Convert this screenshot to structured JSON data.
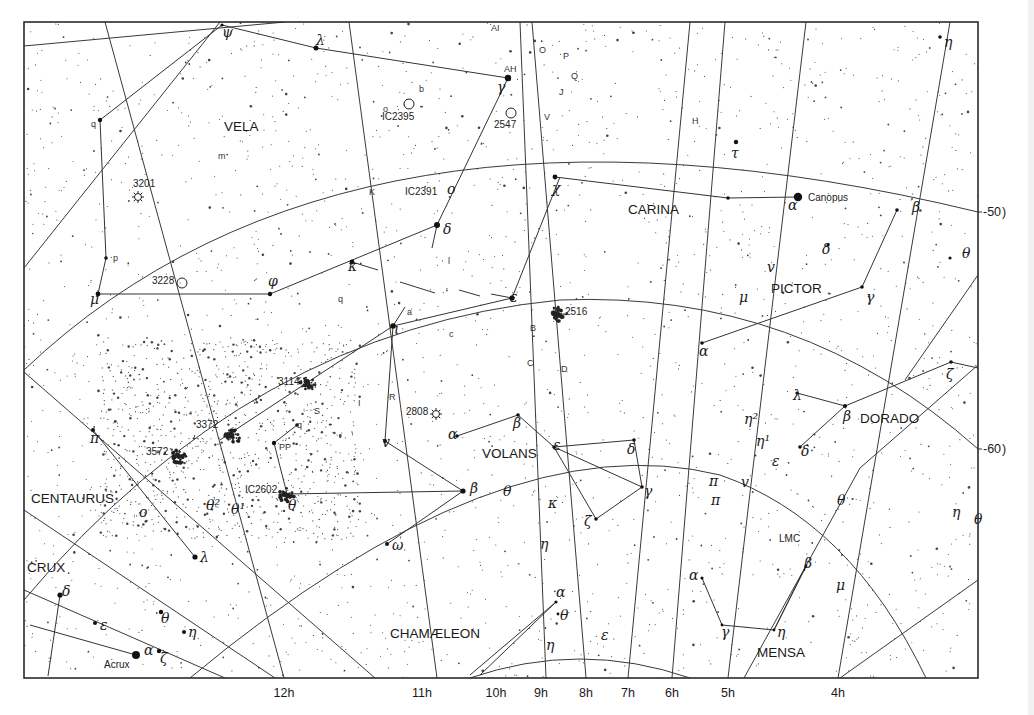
{
  "chart": {
    "frame": {
      "x": 24,
      "y": 22,
      "w": 954,
      "h": 656
    }
  },
  "constellations": [
    {
      "name": "VELA",
      "x": 224,
      "y": 131
    },
    {
      "name": "CARINA",
      "x": 628,
      "y": 214
    },
    {
      "name": "PICTOR",
      "x": 771,
      "y": 293
    },
    {
      "name": "DORADO",
      "x": 860,
      "y": 423
    },
    {
      "name": "VOLANS",
      "x": 482,
      "y": 458
    },
    {
      "name": "CENTAURUS",
      "x": 31,
      "y": 503
    },
    {
      "name": "CRUX",
      "x": 27,
      "y": 572
    },
    {
      "name": "CHAMÆLEON",
      "x": 390,
      "y": 638
    },
    {
      "name": "MENSA",
      "x": 757,
      "y": 657
    }
  ],
  "ra_labels": [
    {
      "label": "12h",
      "x": 284
    },
    {
      "label": "11h",
      "x": 422
    },
    {
      "label": "10h",
      "x": 496
    },
    {
      "label": "9h",
      "x": 541
    },
    {
      "label": "8h",
      "x": 586
    },
    {
      "label": "7h",
      "x": 628
    },
    {
      "label": "6h",
      "x": 672
    },
    {
      "label": "5h",
      "x": 728
    },
    {
      "label": "4h",
      "x": 838
    }
  ],
  "dec_labels": [
    {
      "label": "-50 )",
      "y": 212
    },
    {
      "label": "-60 )",
      "y": 449
    }
  ],
  "named_stars": [
    {
      "name": "Canopus",
      "x": 798,
      "y": 197,
      "r": 4.2,
      "lx": 808,
      "ly": 201
    },
    {
      "name": "Acrux",
      "x": 136,
      "y": 655,
      "r": 4,
      "lx": 104,
      "ly": 668
    }
  ],
  "greek_labels": [
    {
      "t": "ψ",
      "x": 222,
      "y": 37
    },
    {
      "t": "λ",
      "x": 316,
      "y": 45
    },
    {
      "t": "γ",
      "x": 497,
      "y": 92
    },
    {
      "t": "τ",
      "x": 731,
      "y": 158
    },
    {
      "t": "η",
      "x": 944,
      "y": 47
    },
    {
      "t": "o",
      "x": 447,
      "y": 194
    },
    {
      "t": "χ",
      "x": 552,
      "y": 193
    },
    {
      "t": "α",
      "x": 788,
      "y": 210
    },
    {
      "t": "δ",
      "x": 443,
      "y": 234
    },
    {
      "t": "β",
      "x": 912,
      "y": 212
    },
    {
      "t": "κ",
      "x": 348,
      "y": 271
    },
    {
      "t": "δ",
      "x": 822,
      "y": 254
    },
    {
      "t": "v",
      "x": 767,
      "y": 272
    },
    {
      "t": "θ",
      "x": 962,
      "y": 258
    },
    {
      "t": "φ",
      "x": 268,
      "y": 286
    },
    {
      "t": "μ",
      "x": 90,
      "y": 304
    },
    {
      "t": "ε",
      "x": 510,
      "y": 302
    },
    {
      "t": "μ",
      "x": 739,
      "y": 302
    },
    {
      "t": "γ",
      "x": 866,
      "y": 302
    },
    {
      "t": "ι",
      "x": 394,
      "y": 334
    },
    {
      "t": "α",
      "x": 699,
      "y": 356
    },
    {
      "t": "ζ",
      "x": 946,
      "y": 379
    },
    {
      "t": "λ",
      "x": 793,
      "y": 400
    },
    {
      "t": "β",
      "x": 843,
      "y": 421
    },
    {
      "t": "η²",
      "x": 744,
      "y": 424
    },
    {
      "t": "α",
      "x": 448,
      "y": 439
    },
    {
      "t": "β",
      "x": 513,
      "y": 428
    },
    {
      "t": "η¹",
      "x": 756,
      "y": 446
    },
    {
      "t": "v",
      "x": 382,
      "y": 447
    },
    {
      "t": "π",
      "x": 90,
      "y": 443
    },
    {
      "t": "ε",
      "x": 553,
      "y": 450
    },
    {
      "t": "δ",
      "x": 627,
      "y": 454
    },
    {
      "t": "δ",
      "x": 801,
      "y": 456
    },
    {
      "t": "ε",
      "x": 772,
      "y": 466
    },
    {
      "t": "β",
      "x": 470,
      "y": 493
    },
    {
      "t": "γ",
      "x": 644,
      "y": 496
    },
    {
      "t": "π",
      "x": 709,
      "y": 486
    },
    {
      "t": "v",
      "x": 741,
      "y": 487
    },
    {
      "t": "π",
      "x": 711,
      "y": 505
    },
    {
      "t": "θ",
      "x": 503,
      "y": 496
    },
    {
      "t": "κ",
      "x": 548,
      "y": 508
    },
    {
      "t": "θ",
      "x": 837,
      "y": 505
    },
    {
      "t": "η",
      "x": 952,
      "y": 517
    },
    {
      "t": "θ",
      "x": 974,
      "y": 524
    },
    {
      "t": "θ²",
      "x": 206,
      "y": 510
    },
    {
      "t": "θ¹",
      "x": 231,
      "y": 514
    },
    {
      "t": "θ",
      "x": 288,
      "y": 510
    },
    {
      "t": "o",
      "x": 139,
      "y": 517
    },
    {
      "t": "ζ",
      "x": 584,
      "y": 526
    },
    {
      "t": "η",
      "x": 540,
      "y": 549
    },
    {
      "t": "ω",
      "x": 392,
      "y": 550
    },
    {
      "t": "λ",
      "x": 200,
      "y": 562
    },
    {
      "t": "β",
      "x": 804,
      "y": 568
    },
    {
      "t": "α",
      "x": 689,
      "y": 580
    },
    {
      "t": "μ",
      "x": 836,
      "y": 590
    },
    {
      "t": "δ",
      "x": 62,
      "y": 596
    },
    {
      "t": "α",
      "x": 556,
      "y": 597
    },
    {
      "t": "θ",
      "x": 560,
      "y": 620
    },
    {
      "t": "θ",
      "x": 161,
      "y": 623
    },
    {
      "t": "ε",
      "x": 100,
      "y": 630
    },
    {
      "t": "η",
      "x": 188,
      "y": 637
    },
    {
      "t": "ε",
      "x": 601,
      "y": 640
    },
    {
      "t": "η",
      "x": 546,
      "y": 650
    },
    {
      "t": "γ",
      "x": 721,
      "y": 637
    },
    {
      "t": "η",
      "x": 777,
      "y": 637
    },
    {
      "t": "α",
      "x": 144,
      "y": 655
    },
    {
      "t": "ζ",
      "x": 160,
      "y": 663
    }
  ],
  "object_labels": [
    {
      "t": "AI",
      "x": 491,
      "y": 31
    },
    {
      "t": "AH",
      "x": 504,
      "y": 72
    },
    {
      "t": "O",
      "x": 539,
      "y": 53
    },
    {
      "t": "P",
      "x": 563,
      "y": 59
    },
    {
      "t": "Q",
      "x": 571,
      "y": 79
    },
    {
      "t": "J",
      "x": 559,
      "y": 95
    },
    {
      "t": "b",
      "x": 419,
      "y": 92
    },
    {
      "t": "IC2395",
      "x": 382,
      "y": 120
    },
    {
      "t": "o",
      "x": 383,
      "y": 112
    },
    {
      "t": "2547",
      "x": 494,
      "y": 128
    },
    {
      "t": "V",
      "x": 544,
      "y": 120
    },
    {
      "t": "q",
      "x": 91,
      "y": 127
    },
    {
      "t": "m",
      "x": 218,
      "y": 159
    },
    {
      "t": "H",
      "x": 692,
      "y": 124
    },
    {
      "t": "3201",
      "x": 133,
      "y": 187
    },
    {
      "t": "K",
      "x": 369,
      "y": 195
    },
    {
      "t": "IC2391",
      "x": 405,
      "y": 195
    },
    {
      "t": "p",
      "x": 113,
      "y": 261
    },
    {
      "t": "3228",
      "x": 152,
      "y": 284
    },
    {
      "t": "l",
      "x": 448,
      "y": 264
    },
    {
      "t": "a",
      "x": 407,
      "y": 315
    },
    {
      "t": "q",
      "x": 338,
      "y": 302
    },
    {
      "t": "2516",
      "x": 565,
      "y": 315
    },
    {
      "t": "B",
      "x": 530,
      "y": 331
    },
    {
      "t": "c",
      "x": 449,
      "y": 337
    },
    {
      "t": "C",
      "x": 527,
      "y": 366
    },
    {
      "t": "D",
      "x": 561,
      "y": 372
    },
    {
      "t": "3114",
      "x": 278,
      "y": 385
    },
    {
      "t": "R",
      "x": 389,
      "y": 400
    },
    {
      "t": "I",
      "x": 358,
      "y": 406
    },
    {
      "t": "S",
      "x": 314,
      "y": 414
    },
    {
      "t": "q",
      "x": 297,
      "y": 428
    },
    {
      "t": "2808",
      "x": 406,
      "y": 415
    },
    {
      "t": "3372",
      "x": 196,
      "y": 428
    },
    {
      "t": "PP",
      "x": 279,
      "y": 450
    },
    {
      "t": "3572",
      "x": 146,
      "y": 455
    },
    {
      "t": "IC2602",
      "x": 245,
      "y": 493
    },
    {
      "t": "LMC",
      "x": 779,
      "y": 542
    }
  ],
  "deep_sky": [
    {
      "type": "cluster-open",
      "x": 409,
      "y": 104
    },
    {
      "type": "cluster-open",
      "x": 511,
      "y": 113
    },
    {
      "type": "globular",
      "x": 138,
      "y": 197
    },
    {
      "type": "cluster-open",
      "x": 182,
      "y": 283
    },
    {
      "type": "globular",
      "x": 436,
      "y": 414
    },
    {
      "type": "cluster-dense",
      "x": 232,
      "y": 436
    },
    {
      "type": "cluster-dense",
      "x": 179,
      "y": 456
    },
    {
      "type": "cluster-dense",
      "x": 308,
      "y": 383
    },
    {
      "type": "cluster-dense",
      "x": 558,
      "y": 314
    },
    {
      "type": "cluster-dense",
      "x": 287,
      "y": 495
    }
  ],
  "figures": [
    [
      [
        222,
        25
      ],
      [
        100,
        120
      ],
      [
        106,
        258
      ],
      [
        98,
        294
      ],
      [
        270,
        294
      ],
      [
        437,
        225
      ]
    ],
    [
      [
        222,
        25
      ],
      [
        316,
        48
      ],
      [
        508,
        78
      ]
    ],
    [
      [
        508,
        78
      ],
      [
        437,
        225
      ]
    ],
    [
      [
        437,
        225
      ],
      [
        432,
        248
      ]
    ],
    [
      [
        352,
        262
      ],
      [
        378,
        270
      ]
    ],
    [
      [
        400,
        282
      ],
      [
        435,
        293
      ]
    ],
    [
      [
        459,
        290
      ],
      [
        480,
        296
      ]
    ],
    [
      [
        491,
        294
      ],
      [
        512,
        298
      ],
      [
        560,
        177
      ]
    ],
    [
      [
        512,
        298
      ],
      [
        393,
        326
      ],
      [
        385,
        441
      ],
      [
        463,
        491
      ],
      [
        387,
        544
      ]
    ],
    [
      [
        393,
        326
      ],
      [
        220,
        440
      ]
    ],
    [
      [
        393,
        326
      ],
      [
        405,
        307
      ]
    ],
    [
      [
        555,
        177
      ],
      [
        728,
        198
      ],
      [
        798,
        197
      ]
    ],
    [
      [
        702,
        343
      ],
      [
        862,
        287
      ],
      [
        897,
        210
      ]
    ],
    [
      [
        951,
        362
      ],
      [
        845,
        406
      ],
      [
        797,
        393
      ]
    ],
    [
      [
        845,
        406
      ],
      [
        800,
        447
      ]
    ],
    [
      [
        951,
        362
      ],
      [
        978,
        368
      ]
    ],
    [
      [
        457,
        436
      ],
      [
        518,
        415
      ],
      [
        554,
        447
      ],
      [
        634,
        440
      ],
      [
        642,
        487
      ],
      [
        596,
        519
      ],
      [
        554,
        447
      ]
    ],
    [
      [
        554,
        447
      ],
      [
        642,
        487
      ]
    ],
    [
      [
        274,
        443
      ],
      [
        287,
        494
      ],
      [
        463,
        491
      ]
    ],
    [
      [
        274,
        443
      ],
      [
        297,
        425
      ]
    ],
    [
      [
        93,
        430
      ],
      [
        195,
        557
      ]
    ],
    [
      [
        60,
        595
      ],
      [
        48,
        676
      ]
    ],
    [
      [
        30,
        625
      ],
      [
        136,
        655
      ]
    ],
    [
      [
        556,
        602
      ],
      [
        470,
        675
      ]
    ],
    [
      [
        556,
        602
      ],
      [
        480,
        675
      ]
    ],
    [
      [
        702,
        578
      ],
      [
        722,
        625
      ],
      [
        774,
        630
      ],
      [
        806,
        566
      ]
    ],
    [
      [
        806,
        566
      ],
      [
        774,
        630
      ]
    ]
  ],
  "bright_stars": [
    [
      316,
      48,
      2.5
    ],
    [
      508,
      78,
      3.2
    ],
    [
      100,
      120,
      2.2
    ],
    [
      437,
      225,
      3
    ],
    [
      555,
      177,
      2.4
    ],
    [
      728,
      198,
      1.8
    ],
    [
      352,
      262,
      2.4
    ],
    [
      270,
      294,
      2.2
    ],
    [
      98,
      294,
      2.4
    ],
    [
      512,
      298,
      2.6
    ],
    [
      393,
      326,
      2.8
    ],
    [
      702,
      343,
      1.8
    ],
    [
      862,
      287,
      1.8
    ],
    [
      897,
      210,
      1.8
    ],
    [
      951,
      362,
      1.8
    ],
    [
      845,
      406,
      2
    ],
    [
      797,
      393,
      1.6
    ],
    [
      800,
      447,
      1.8
    ],
    [
      457,
      436,
      1.8
    ],
    [
      518,
      415,
      1.8
    ],
    [
      554,
      447,
      1.8
    ],
    [
      634,
      440,
      1.8
    ],
    [
      642,
      487,
      1.8
    ],
    [
      596,
      519,
      1.8
    ],
    [
      463,
      491,
      2.6
    ],
    [
      385,
      441,
      2
    ],
    [
      387,
      544,
      2
    ],
    [
      274,
      443,
      2.2
    ],
    [
      297,
      425,
      1.8
    ],
    [
      93,
      430,
      2
    ],
    [
      195,
      557,
      2.6
    ],
    [
      60,
      595,
      2.6
    ],
    [
      106,
      258,
      1.8
    ],
    [
      736,
      142,
      2.2
    ],
    [
      940,
      37,
      1.8
    ],
    [
      222,
      25,
      1.6
    ],
    [
      702,
      578,
      1.6
    ],
    [
      722,
      625,
      1.4
    ],
    [
      774,
      630,
      1.4
    ],
    [
      806,
      566,
      1.4
    ],
    [
      556,
      602,
      1.6
    ],
    [
      558,
      614,
      1.4
    ],
    [
      828,
      245,
      1.6
    ],
    [
      950,
      258,
      1.6
    ],
    [
      161,
      612,
      2.2
    ],
    [
      184,
      632,
      2
    ],
    [
      159,
      651,
      2.2
    ],
    [
      95,
      623,
      2
    ]
  ],
  "grid_lines": {
    "meridians": [
      [
        [
          105,
          22
        ],
        [
          284,
          678
        ]
      ],
      [
        [
          349,
          22
        ],
        [
          437,
          678
        ]
      ],
      [
        [
          520,
          22
        ],
        [
          546,
          678
        ]
      ],
      [
        [
          532,
          22
        ],
        [
          586,
          678
        ]
      ],
      [
        [
          690,
          22
        ],
        [
          628,
          678
        ]
      ],
      [
        [
          725,
          22
        ],
        [
          672,
          678
        ]
      ],
      [
        [
          806,
          22
        ],
        [
          728,
          678
        ]
      ],
      [
        [
          950,
          22
        ],
        [
          838,
          678
        ]
      ],
      [
        [
          24,
          46
        ],
        [
          285,
          22
        ]
      ],
      [
        [
          24,
          268
        ],
        [
          220,
          22
        ]
      ],
      [
        [
          24,
          372
        ],
        [
          375,
          678
        ]
      ],
      [
        [
          24,
          510
        ],
        [
          275,
          678
        ]
      ],
      [
        [
          24,
          590
        ],
        [
          225,
          678
        ]
      ]
    ],
    "parallels": [
      "M 24 370 Q 350 60 978 212",
      "M 24 600 Q 250 330 560 300 Q 800 290 978 449",
      "M 190 678 Q 500 420 720 475 Q 850 520 926 678",
      "M 470 678 Q 580 640 690 678"
    ],
    "extra": [
      [
        [
          978,
          365
        ],
        [
          860,
          468
        ],
        [
          744,
          678
        ]
      ],
      [
        [
          978,
          580
        ],
        [
          840,
          678
        ]
      ],
      [
        [
          978,
          275
        ],
        [
          905,
          380
        ]
      ]
    ]
  }
}
